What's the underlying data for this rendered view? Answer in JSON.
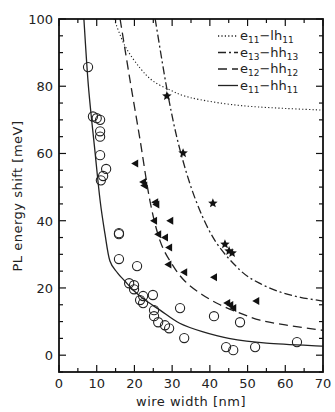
{
  "chart_data": {
    "type": "scatter",
    "title": "",
    "xlabel": "wire width [nm]",
    "ylabel": "PL energy shift [meV]",
    "xlim": [
      0,
      70
    ],
    "ylim": [
      -5,
      100
    ],
    "xticks": [
      0,
      10,
      20,
      30,
      40,
      50,
      60,
      70
    ],
    "yticks": [
      0,
      20,
      40,
      60,
      80,
      100
    ],
    "grid": false,
    "legend_position": "upper right",
    "legend": [
      {
        "style": "dotted",
        "label": "e11-lh11",
        "main1": "e",
        "sub1": "11",
        "main2": "−lh",
        "sub2": "11"
      },
      {
        "style": "dashdot",
        "label": "e13-hh13",
        "main1": "e",
        "sub1": "13",
        "main2": "−hh",
        "sub2": "13"
      },
      {
        "style": "dashed",
        "label": "e12-hh12",
        "main1": "e",
        "sub1": "12",
        "main2": "−hh",
        "sub2": "12"
      },
      {
        "style": "solid",
        "label": "e11-hh11",
        "main1": "e",
        "sub1": "11",
        "main2": "−hh",
        "sub2": "11"
      }
    ],
    "curves": [
      {
        "name": "e11-lh11",
        "style": "dotted",
        "x": [
          14.6,
          17.5,
          21.5,
          25,
          29.4,
          33,
          37.4,
          44,
          50.7,
          60,
          70
        ],
        "y": [
          100,
          92,
          85.4,
          81.5,
          78.9,
          77.2,
          76,
          74.8,
          74,
          73.4,
          72.9
        ]
      },
      {
        "name": "e13-hh13",
        "style": "dashdot",
        "x": [
          25.5,
          28.9,
          32.1,
          36.3,
          41.4,
          48,
          53,
          58.6,
          64,
          70
        ],
        "y": [
          100,
          77.4,
          61,
          46,
          34,
          25.3,
          21.5,
          18.8,
          17.2,
          16.1
        ]
      },
      {
        "name": "e12-hh12",
        "style": "dashed",
        "x": [
          16.2,
          18.8,
          21.5,
          24.1,
          26.8,
          30,
          33.4,
          38,
          42.7,
          48,
          53.3,
          60,
          70
        ],
        "y": [
          100,
          82,
          64,
          46,
          34,
          27,
          22,
          18,
          15,
          12.5,
          10.4,
          9,
          7.4
        ]
      },
      {
        "name": "e11-hh11",
        "style": "solid",
        "x": [
          6.6,
          7.8,
          9.5,
          10.9,
          12.2,
          13.5,
          15.5,
          17.5,
          20,
          22.8,
          26.8,
          32,
          38,
          45,
          55,
          70
        ],
        "y": [
          100,
          80,
          61,
          46,
          36,
          28,
          24.5,
          22,
          19,
          16.4,
          13.4,
          9.5,
          7,
          5,
          3.6,
          2.7
        ]
      }
    ],
    "series": [
      {
        "name": "e11-hh11 data",
        "marker": "open-circle",
        "points": [
          [
            7.7,
            85.7
          ],
          [
            9.0,
            71
          ],
          [
            10.0,
            70.5
          ],
          [
            10.9,
            70
          ],
          [
            10.9,
            66.6
          ],
          [
            10.9,
            65
          ],
          [
            10.9,
            59.5
          ],
          [
            12.5,
            55.4
          ],
          [
            11.7,
            53.3
          ],
          [
            11.1,
            52
          ],
          [
            15.9,
            36.3
          ],
          [
            15.9,
            36
          ],
          [
            15.9,
            28.6
          ],
          [
            20.7,
            26.5
          ],
          [
            18.6,
            21.4
          ],
          [
            19.9,
            20.8
          ],
          [
            19.9,
            19.6
          ],
          [
            22.3,
            17.6
          ],
          [
            21.5,
            16.4
          ],
          [
            22.3,
            15.5
          ],
          [
            24.9,
            17.9
          ],
          [
            25.2,
            13.4
          ],
          [
            25.2,
            11.6
          ],
          [
            26.3,
            9.8
          ],
          [
            28.1,
            8.9
          ],
          [
            29.2,
            8.0
          ],
          [
            32.1,
            14.0
          ],
          [
            33.2,
            5.1
          ],
          [
            41.1,
            11.6
          ],
          [
            48.0,
            9.8
          ],
          [
            44.3,
            2.4
          ],
          [
            46.2,
            1.5
          ],
          [
            52.0,
            2.4
          ],
          [
            63.1,
            3.9
          ]
        ]
      },
      {
        "name": "e12-hh12 data",
        "marker": "filled-triangle",
        "points": [
          [
            20.2,
            57
          ],
          [
            22.3,
            51.5
          ],
          [
            22.6,
            50.5
          ],
          [
            25.5,
            45.5
          ],
          [
            25.8,
            44.8
          ],
          [
            25.2,
            40
          ],
          [
            29.5,
            40
          ],
          [
            26.3,
            36
          ],
          [
            28.1,
            35
          ],
          [
            29.2,
            32
          ],
          [
            29.0,
            27
          ],
          [
            33.2,
            24.7
          ],
          [
            41.1,
            23.2
          ],
          [
            44.6,
            15.5
          ],
          [
            45.4,
            14.9
          ],
          [
            46.2,
            14.0
          ],
          [
            52.3,
            16.1
          ]
        ]
      },
      {
        "name": "e13-hh13 data",
        "marker": "filled-star",
        "points": [
          [
            28.6,
            77.1
          ],
          [
            32.9,
            60.1
          ],
          [
            40.8,
            45.2
          ],
          [
            44.0,
            33.0
          ],
          [
            45.1,
            31.0
          ],
          [
            45.9,
            30.4
          ]
        ]
      }
    ]
  }
}
